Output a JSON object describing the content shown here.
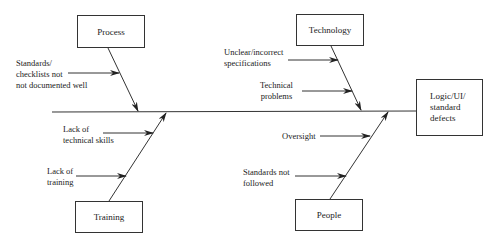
{
  "diagram": {
    "type": "fishbone",
    "effect": {
      "label": "Logic/UI/\nstandard\ndefects"
    },
    "categories": [
      {
        "id": "process",
        "label": "Process",
        "position": "top-left",
        "causes": [
          "Standards/\nchecklists not\nnot documented well"
        ]
      },
      {
        "id": "technology",
        "label": "Technology",
        "position": "top-right",
        "causes": [
          "Unclear/incorrect\nspecifications",
          "Technical\nproblems"
        ]
      },
      {
        "id": "training",
        "label": "Training",
        "position": "bottom-left",
        "causes": [
          "Lack of\ntechnical skills",
          "Lack of\ntraining"
        ]
      },
      {
        "id": "people",
        "label": "People",
        "position": "bottom-right",
        "causes": [
          "Oversight",
          "Standards not\nfollowed"
        ]
      }
    ],
    "colors": {
      "line": "#333333",
      "background": "#ffffff",
      "text": "#222222"
    }
  }
}
